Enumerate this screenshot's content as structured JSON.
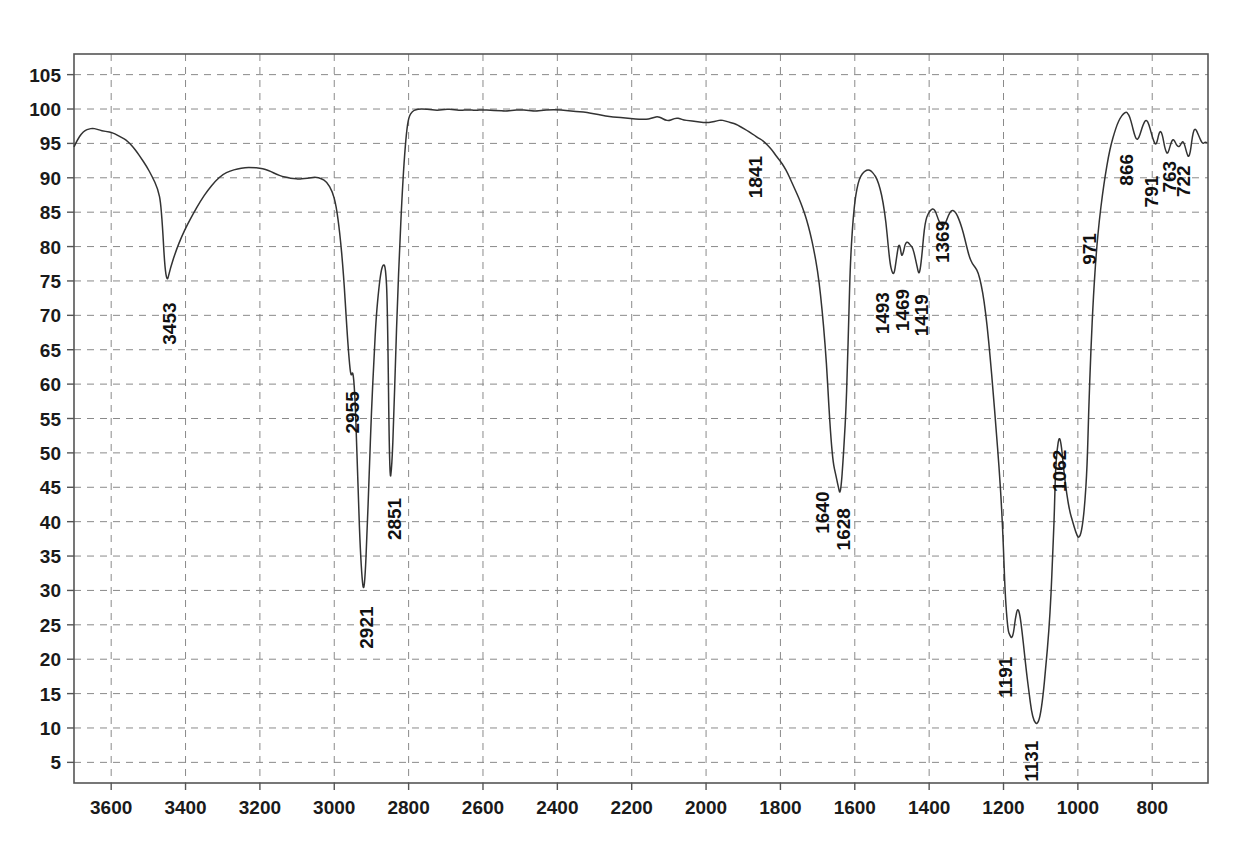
{
  "chart_data": {
    "type": "line",
    "title": "",
    "subtitle": "",
    "xlabel": "",
    "ylabel": "",
    "grid": true,
    "legend": "none",
    "xlim": [
      3700,
      650
    ],
    "ylim": [
      2,
      108
    ],
    "x_ticks": [
      3600,
      3400,
      3200,
      3000,
      2800,
      2600,
      2400,
      2200,
      2000,
      1800,
      1600,
      1400,
      1200,
      1000,
      800
    ],
    "y_ticks": [
      5,
      10,
      15,
      20,
      25,
      30,
      35,
      40,
      45,
      50,
      55,
      60,
      65,
      70,
      75,
      80,
      85,
      90,
      95,
      100,
      105
    ],
    "x_axis_direction": "descending",
    "line_color": "#333333",
    "grid_color": "#8a8a8a",
    "axis_color": "#555555",
    "annotations": [
      {
        "label": "3453",
        "x": 3453,
        "y": 74.2
      },
      {
        "label": "2955",
        "x": 2955,
        "y": 61.0
      },
      {
        "label": "2921",
        "x": 2921,
        "y": 30.0
      },
      {
        "label": "2851",
        "x": 2851,
        "y": 45.5
      },
      {
        "label": "1841",
        "x": 1841,
        "y": 95.5
      },
      {
        "label": "1640",
        "x": 1640,
        "y": 47.0
      },
      {
        "label": "1628",
        "x": 1628,
        "y": 44.0
      },
      {
        "label": "1493",
        "x": 1493,
        "y": 76.0
      },
      {
        "label": "1469",
        "x": 1469,
        "y": 78.5
      },
      {
        "label": "1419",
        "x": 1419,
        "y": 76.0
      },
      {
        "label": "1369",
        "x": 1369,
        "y": 85.5
      },
      {
        "label": "1191",
        "x": 1191,
        "y": 23.0
      },
      {
        "label": "1131",
        "x": 1131,
        "y": 10.5
      },
      {
        "label": "1062",
        "x": 1062,
        "y": 52.5
      },
      {
        "label": "971",
        "x": 971,
        "y": 84.0
      },
      {
        "label": "866",
        "x": 866,
        "y": 95.5
      },
      {
        "label": "791",
        "x": 791,
        "y": 93.5
      },
      {
        "label": "763",
        "x": 763,
        "y": 94.5
      },
      {
        "label": "722",
        "x": 722,
        "y": 95.0
      }
    ],
    "x": [
      3700,
      3690,
      3680,
      3670,
      3660,
      3650,
      3640,
      3630,
      3620,
      3610,
      3600,
      3590,
      3580,
      3570,
      3560,
      3550,
      3540,
      3530,
      3520,
      3505,
      3490,
      3475,
      3465,
      3453,
      3440,
      3425,
      3410,
      3395,
      3380,
      3360,
      3340,
      3320,
      3300,
      3280,
      3260,
      3240,
      3220,
      3200,
      3185,
      3170,
      3155,
      3140,
      3125,
      3110,
      3095,
      3080,
      3065,
      3050,
      3035,
      3020,
      3005,
      2995,
      2985,
      2975,
      2966,
      2960,
      2955,
      2950,
      2945,
      2940,
      2935,
      2930,
      2925,
      2921,
      2917,
      2912,
      2906,
      2900,
      2893,
      2887,
      2880,
      2874,
      2868,
      2862,
      2857,
      2851,
      2845,
      2840,
      2835,
      2830,
      2824,
      2818,
      2812,
      2806,
      2800,
      2790,
      2780,
      2770,
      2760,
      2740,
      2720,
      2700,
      2680,
      2660,
      2640,
      2620,
      2600,
      2580,
      2560,
      2540,
      2520,
      2500,
      2480,
      2460,
      2440,
      2420,
      2400,
      2380,
      2360,
      2340,
      2320,
      2300,
      2280,
      2260,
      2240,
      2220,
      2200,
      2180,
      2160,
      2150,
      2140,
      2130,
      2120,
      2110,
      2100,
      2090,
      2080,
      2070,
      2060,
      2045,
      2030,
      2015,
      2000,
      1985,
      1970,
      1960,
      1950,
      1940,
      1930,
      1920,
      1910,
      1900,
      1890,
      1880,
      1870,
      1860,
      1850,
      1841,
      1832,
      1822,
      1812,
      1800,
      1790,
      1780,
      1770,
      1760,
      1750,
      1740,
      1730,
      1720,
      1710,
      1700,
      1692,
      1684,
      1676,
      1670,
      1664,
      1658,
      1652,
      1648,
      1644,
      1640,
      1636,
      1632,
      1628,
      1624,
      1620,
      1616,
      1612,
      1606,
      1600,
      1594,
      1588,
      1580,
      1572,
      1564,
      1556,
      1548,
      1540,
      1532,
      1524,
      1516,
      1510,
      1505,
      1500,
      1496,
      1493,
      1490,
      1486,
      1482,
      1478,
      1474,
      1469,
      1465,
      1460,
      1455,
      1450,
      1444,
      1438,
      1432,
      1428,
      1424,
      1419,
      1415,
      1411,
      1406,
      1400,
      1394,
      1388,
      1382,
      1376,
      1369,
      1362,
      1355,
      1348,
      1340,
      1332,
      1324,
      1316,
      1308,
      1300,
      1292,
      1284,
      1276,
      1268,
      1260,
      1252,
      1244,
      1236,
      1228,
      1220,
      1212,
      1205,
      1200,
      1196,
      1191,
      1187,
      1183,
      1178,
      1173,
      1168,
      1162,
      1156,
      1150,
      1144,
      1138,
      1131,
      1125,
      1118,
      1110,
      1102,
      1094,
      1086,
      1078,
      1072,
      1068,
      1064,
      1062,
      1060,
      1056,
      1050,
      1044,
      1038,
      1030,
      1022,
      1014,
      1006,
      998,
      990,
      982,
      975,
      971,
      965,
      958,
      950,
      942,
      934,
      926,
      918,
      910,
      902,
      894,
      886,
      878,
      870,
      866,
      860,
      854,
      848,
      842,
      836,
      830,
      824,
      818,
      812,
      806,
      800,
      795,
      791,
      787,
      783,
      779,
      775,
      771,
      767,
      763,
      759,
      755,
      750,
      745,
      740,
      735,
      730,
      726,
      722,
      718,
      714,
      710,
      706,
      702,
      698,
      694,
      690,
      686,
      682,
      678,
      674,
      670,
      666,
      662,
      658,
      652
    ],
    "y": [
      94.5,
      95.6,
      96.4,
      96.9,
      97.1,
      97.2,
      97.1,
      96.9,
      96.8,
      96.7,
      96.6,
      96.4,
      96.1,
      95.8,
      95.5,
      95.0,
      94.4,
      93.7,
      92.9,
      91.7,
      90.2,
      88.5,
      86.0,
      74.2,
      77.0,
      79.5,
      81.5,
      83.2,
      84.7,
      86.6,
      88.2,
      89.5,
      90.5,
      91.0,
      91.3,
      91.5,
      91.5,
      91.4,
      91.2,
      90.9,
      90.5,
      90.2,
      90.0,
      89.9,
      89.8,
      89.9,
      90.0,
      90.1,
      89.9,
      89.4,
      88.0,
      86.0,
      82.0,
      76.0,
      68.0,
      63.5,
      61.0,
      62.0,
      59.0,
      52.0,
      43.0,
      36.0,
      31.5,
      30.0,
      32.0,
      38.0,
      47.0,
      56.0,
      64.0,
      70.0,
      74.0,
      76.5,
      77.5,
      77.0,
      72.0,
      45.5,
      48.0,
      55.0,
      64.0,
      72.0,
      80.0,
      87.0,
      92.5,
      96.5,
      98.8,
      99.7,
      99.9,
      100.0,
      100.0,
      99.9,
      99.8,
      100.0,
      99.9,
      99.8,
      99.9,
      99.8,
      99.9,
      99.8,
      99.8,
      99.7,
      99.8,
      99.9,
      99.8,
      99.7,
      99.8,
      99.9,
      99.9,
      99.8,
      99.7,
      99.6,
      99.5,
      99.3,
      99.1,
      98.9,
      98.8,
      98.7,
      98.6,
      98.5,
      98.5,
      98.6,
      98.8,
      98.9,
      98.7,
      98.4,
      98.3,
      98.5,
      98.7,
      98.6,
      98.4,
      98.3,
      98.2,
      98.1,
      98.0,
      98.1,
      98.3,
      98.4,
      98.3,
      98.1,
      98.0,
      97.8,
      97.5,
      97.2,
      96.9,
      96.5,
      96.2,
      95.8,
      95.5,
      95.1,
      94.6,
      94.0,
      93.2,
      92.4,
      91.6,
      90.6,
      89.4,
      88.2,
      87.0,
      85.6,
      84.0,
      82.0,
      79.5,
      76.5,
      73.0,
      68.5,
      63.0,
      57.0,
      52.0,
      48.5,
      47.0,
      46.0,
      45.0,
      44.0,
      45.5,
      48.5,
      52.0,
      56.0,
      62.0,
      70.0,
      77.5,
      83.0,
      86.5,
      88.5,
      89.8,
      90.6,
      91.0,
      91.2,
      91.0,
      90.5,
      89.8,
      88.5,
      86.5,
      83.5,
      80.0,
      77.5,
      76.3,
      76.0,
      76.4,
      77.5,
      79.0,
      80.3,
      80.0,
      78.5,
      79.2,
      80.3,
      80.7,
      80.5,
      80.2,
      79.8,
      78.5,
      77.0,
      76.0,
      76.6,
      79.0,
      81.5,
      83.3,
      84.4,
      85.0,
      85.4,
      85.5,
      85.0,
      84.0,
      83.2,
      83.0,
      83.5,
      84.6,
      85.3,
      85.2,
      84.5,
      83.4,
      82.0,
      80.2,
      78.5,
      77.5,
      77.0,
      76.2,
      74.5,
      72.0,
      68.5,
      64.0,
      59.0,
      53.5,
      48.0,
      42.0,
      36.0,
      30.0,
      26.0,
      24.0,
      23.5,
      23.0,
      23.8,
      26.0,
      27.5,
      26.5,
      24.0,
      21.0,
      18.0,
      15.0,
      12.5,
      11.0,
      10.5,
      11.5,
      14.5,
      19.0,
      24.0,
      29.5,
      35.0,
      40.0,
      44.0,
      47.5,
      50.5,
      52.5,
      51.0,
      47.5,
      44.0,
      41.5,
      40.0,
      38.5,
      37.5,
      38.5,
      42.0,
      48.0,
      56.0,
      65.0,
      73.0,
      79.5,
      84.0,
      87.5,
      90.5,
      93.0,
      95.0,
      96.5,
      97.8,
      98.7,
      99.3,
      99.6,
      99.4,
      98.8,
      97.6,
      96.3,
      95.5,
      95.8,
      96.8,
      97.8,
      98.4,
      98.2,
      97.2,
      96.0,
      95.2,
      94.8,
      95.2,
      96.2,
      96.8,
      96.6,
      95.8,
      94.6,
      93.8,
      93.5,
      94.0,
      95.0,
      95.6,
      95.4,
      94.8,
      94.5,
      94.6,
      95.0,
      95.3,
      95.0,
      94.2,
      93.4,
      93.0,
      93.6,
      95.2,
      96.6,
      97.1,
      97.0,
      96.5,
      96.0,
      95.5,
      95.1,
      95.0,
      95.2,
      95.1,
      94.5,
      93.0,
      91.0,
      89.0,
      87.5,
      86.8,
      86.5,
      86.4,
      86.3,
      86.2
    ]
  }
}
